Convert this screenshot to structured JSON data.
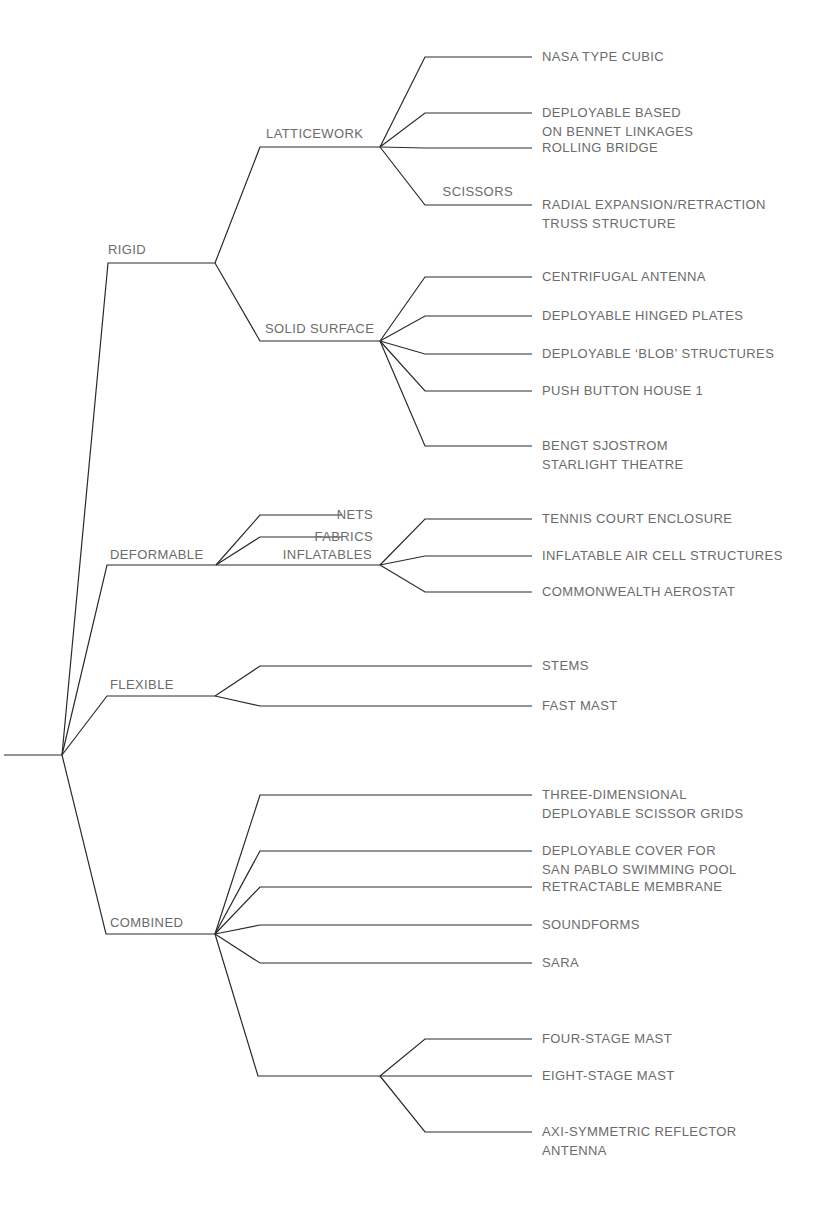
{
  "diagram": {
    "type": "taxonomy-tree",
    "line_color": "#2a2a2a",
    "text_color": "#6b6b6b",
    "root": {
      "x": 62,
      "y": 755,
      "stub_from_x": 4
    },
    "categories": [
      {
        "label": "RIGID",
        "label_pos": [
          108,
          240
        ],
        "elbow": [
          108,
          263
        ],
        "hub": [
          215,
          263
        ],
        "subcategories": [
          {
            "label": "LATTICEWORK",
            "label_pos": [
              266,
              124
            ],
            "elbow": [
              260,
              147
            ],
            "hub": [
              380,
              147
            ],
            "leaves": [
              {
                "label": "NASA TYPE CUBIC",
                "y": 57,
                "lines": [
                  "NASA TYPE CUBIC"
                ]
              },
              {
                "label": "DEPLOYABLE BASED ON BENNET LINKAGES",
                "y": 113,
                "lines": [
                  "DEPLOYABLE BASED",
                  "ON BENNET LINKAGES"
                ]
              },
              {
                "label": "ROLLING BRIDGE",
                "y": 148,
                "lines": [
                  "ROLLING BRIDGE"
                ]
              },
              {
                "label": "RADIAL EXPANSION/RETRACTION TRUSS STRUCTURE",
                "y": 205,
                "lines": [
                  "RADIAL EXPANSION/RETRACTION",
                  "TRUSS STRUCTURE"
                ],
                "branch_label": "SCISSORS"
              }
            ]
          },
          {
            "label": "SOLID SURFACE",
            "label_pos": [
              265,
              319
            ],
            "elbow": [
              260,
              341
            ],
            "hub": [
              380,
              341
            ],
            "leaves": [
              {
                "label": "CENTRIFUGAL ANTENNA",
                "y": 277,
                "lines": [
                  "CENTRIFUGAL ANTENNA"
                ]
              },
              {
                "label": "DEPLOYABLE HINGED PLATES",
                "y": 316,
                "lines": [
                  "DEPLOYABLE HINGED PLATES"
                ]
              },
              {
                "label": "DEPLOYABLE 'BLOB' STRUCTURES",
                "y": 354,
                "lines": [
                  "DEPLOYABLE ‘BLOB’ STRUCTURES"
                ]
              },
              {
                "label": "PUSH BUTTON HOUSE 1",
                "y": 391,
                "lines": [
                  "PUSH BUTTON HOUSE 1"
                ]
              },
              {
                "label": "BENGT SJOSTROM STARLIGHT THEATRE",
                "y": 446,
                "lines": [
                  "BENGT SJOSTROM",
                  "STARLIGHT THEATRE"
                ]
              }
            ]
          }
        ]
      },
      {
        "label": "DEFORMABLE",
        "label_pos": [
          110,
          545
        ],
        "elbow": [
          107,
          565
        ],
        "hub": [
          216,
          565
        ],
        "side_branches": [
          {
            "label": "NETS",
            "y": 515
          },
          {
            "label": "FABRICS",
            "y": 537
          }
        ],
        "subcategories": [
          {
            "label": "INFLATABLES",
            "label_pos": [
              372,
              545
            ],
            "hub": [
              380,
              565
            ],
            "leaves": [
              {
                "label": "TENNIS COURT ENCLOSURE",
                "y": 519,
                "lines": [
                  "TENNIS COURT ENCLOSURE"
                ]
              },
              {
                "label": "INFLATABLE AIR CELL STRUCTURES",
                "y": 556,
                "lines": [
                  "INFLATABLE AIR CELL STRUCTURES"
                ]
              },
              {
                "label": "COMMONWEALTH AEROSTAT",
                "y": 592,
                "lines": [
                  "COMMONWEALTH AEROSTAT"
                ]
              }
            ]
          }
        ]
      },
      {
        "label": "FLEXIBLE",
        "label_pos": [
          110,
          675
        ],
        "elbow": [
          107,
          696
        ],
        "hub": [
          215,
          696
        ],
        "leaves": [
          {
            "label": "STEMS",
            "y": 666,
            "lines": [
              "STEMS"
            ]
          },
          {
            "label": "FAST MAST",
            "y": 706,
            "lines": [
              "FAST MAST"
            ]
          }
        ]
      },
      {
        "label": "COMBINED",
        "label_pos": [
          110,
          913
        ],
        "elbow": [
          106,
          934
        ],
        "hub": [
          215,
          934
        ],
        "leaves": [
          {
            "label": "THREE-DIMENSIONAL DEPLOYABLE SCISSOR GRIDS",
            "y": 795,
            "lines": [
              "THREE-DIMENSIONAL",
              "DEPLOYABLE SCISSOR GRIDS"
            ]
          },
          {
            "label": "DEPLOYABLE COVER FOR SAN PABLO SWIMMING POOL",
            "y": 851,
            "lines": [
              "DEPLOYABLE COVER FOR",
              "SAN PABLO SWIMMING POOL"
            ]
          },
          {
            "label": "RETRACTABLE MEMBRANE",
            "y": 887,
            "lines": [
              "RETRACTABLE MEMBRANE"
            ]
          },
          {
            "label": "SOUNDFORMS",
            "y": 925,
            "lines": [
              "SOUNDFORMS"
            ]
          },
          {
            "label": "SARA",
            "y": 963,
            "lines": [
              "SARA"
            ]
          }
        ],
        "subcategories": [
          {
            "label": "",
            "elbow": [
              258,
              1076
            ],
            "hub": [
              380,
              1076
            ],
            "leaves": [
              {
                "label": "FOUR-STAGE MAST",
                "y": 1039,
                "lines": [
                  "FOUR-STAGE MAST"
                ]
              },
              {
                "label": "EIGHT-STAGE MAST",
                "y": 1076,
                "lines": [
                  "EIGHT-STAGE MAST"
                ]
              },
              {
                "label": "AXI-SYMMETRIC REFLECTOR ANTENNA",
                "y": 1132,
                "lines": [
                  "AXI-SYMMETRIC REFLECTOR",
                  "ANTENNA"
                ]
              }
            ]
          }
        ]
      }
    ],
    "leaf_line": {
      "start_x": 425,
      "end_x": 532,
      "text_x": 542
    }
  }
}
